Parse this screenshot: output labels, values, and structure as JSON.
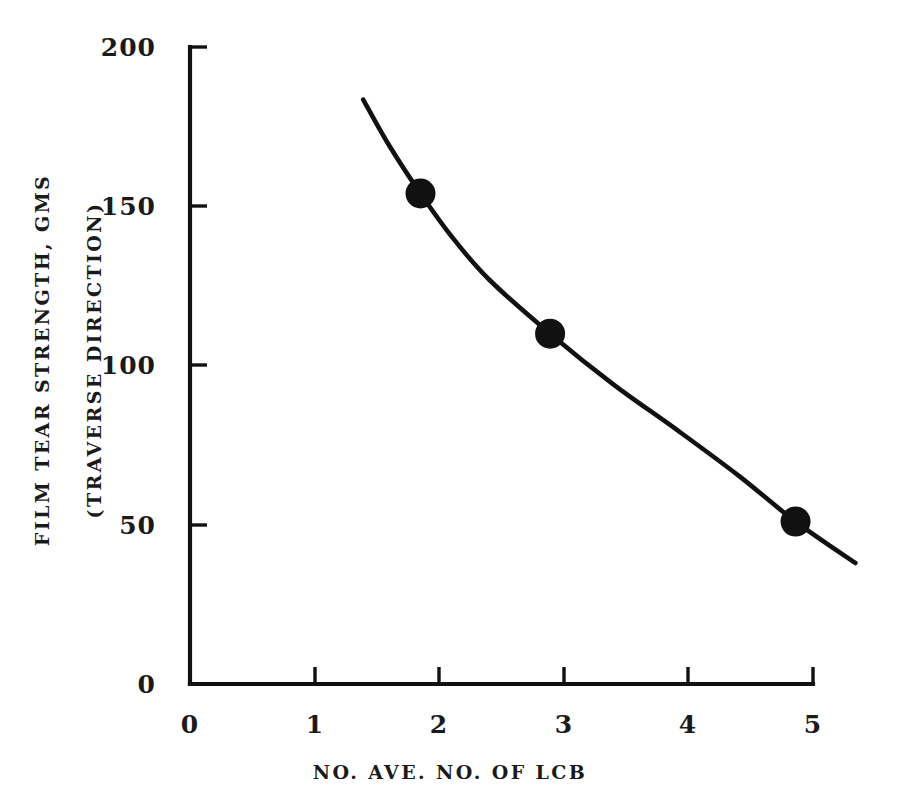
{
  "chart_data": {
    "type": "line",
    "title": "",
    "subtitle": "",
    "xlabel": "NO. AVE. NO. OF LCB",
    "ylabel_line1": "FILM TEAR STRENGTH, GMS",
    "ylabel_line2": "(TRAVERSE DIRECTION)",
    "xlim": [
      0,
      5
    ],
    "ylim": [
      0,
      200
    ],
    "grid": false,
    "legend": false,
    "legend_position": "none",
    "x_ticks": [
      0,
      1,
      2,
      3,
      4,
      5
    ],
    "x_tick_labels": [
      "0",
      "1",
      "2",
      "3",
      "4",
      "5"
    ],
    "y_ticks": [
      0,
      50,
      100,
      150,
      200
    ],
    "y_tick_labels": [
      "0",
      "50",
      "100",
      "150",
      "200"
    ],
    "series": [
      {
        "name": "Film tear strength vs LCB",
        "marker": "filled-circle",
        "color": "#111111",
        "points": [
          {
            "x": 1.85,
            "y": 154
          },
          {
            "x": 2.89,
            "y": 110
          },
          {
            "x": 4.86,
            "y": 51
          }
        ],
        "curve_x": [
          1.39,
          1.6,
          1.85,
          2.1,
          2.4,
          2.89,
          3.4,
          3.9,
          4.4,
          4.86,
          5.34
        ],
        "curve_y": [
          183.5,
          169.0,
          154.0,
          140.5,
          127.0,
          110.0,
          94.0,
          80.0,
          65.5,
          51.0,
          38.0
        ]
      }
    ]
  },
  "axes": {
    "y_tick_labels": [
      "200",
      "150",
      "100",
      "50",
      "0"
    ],
    "x_tick_labels": [
      "0",
      "1",
      "2",
      "3",
      "4",
      "5"
    ],
    "x_title": "NO. AVE. NO. OF LCB",
    "y_title_line1": "FILM TEAR STRENGTH, GMS",
    "y_title_line2": "(TRAVERSE DIRECTION)"
  },
  "style": {
    "background": "#ffffff",
    "ink": "#111111"
  }
}
